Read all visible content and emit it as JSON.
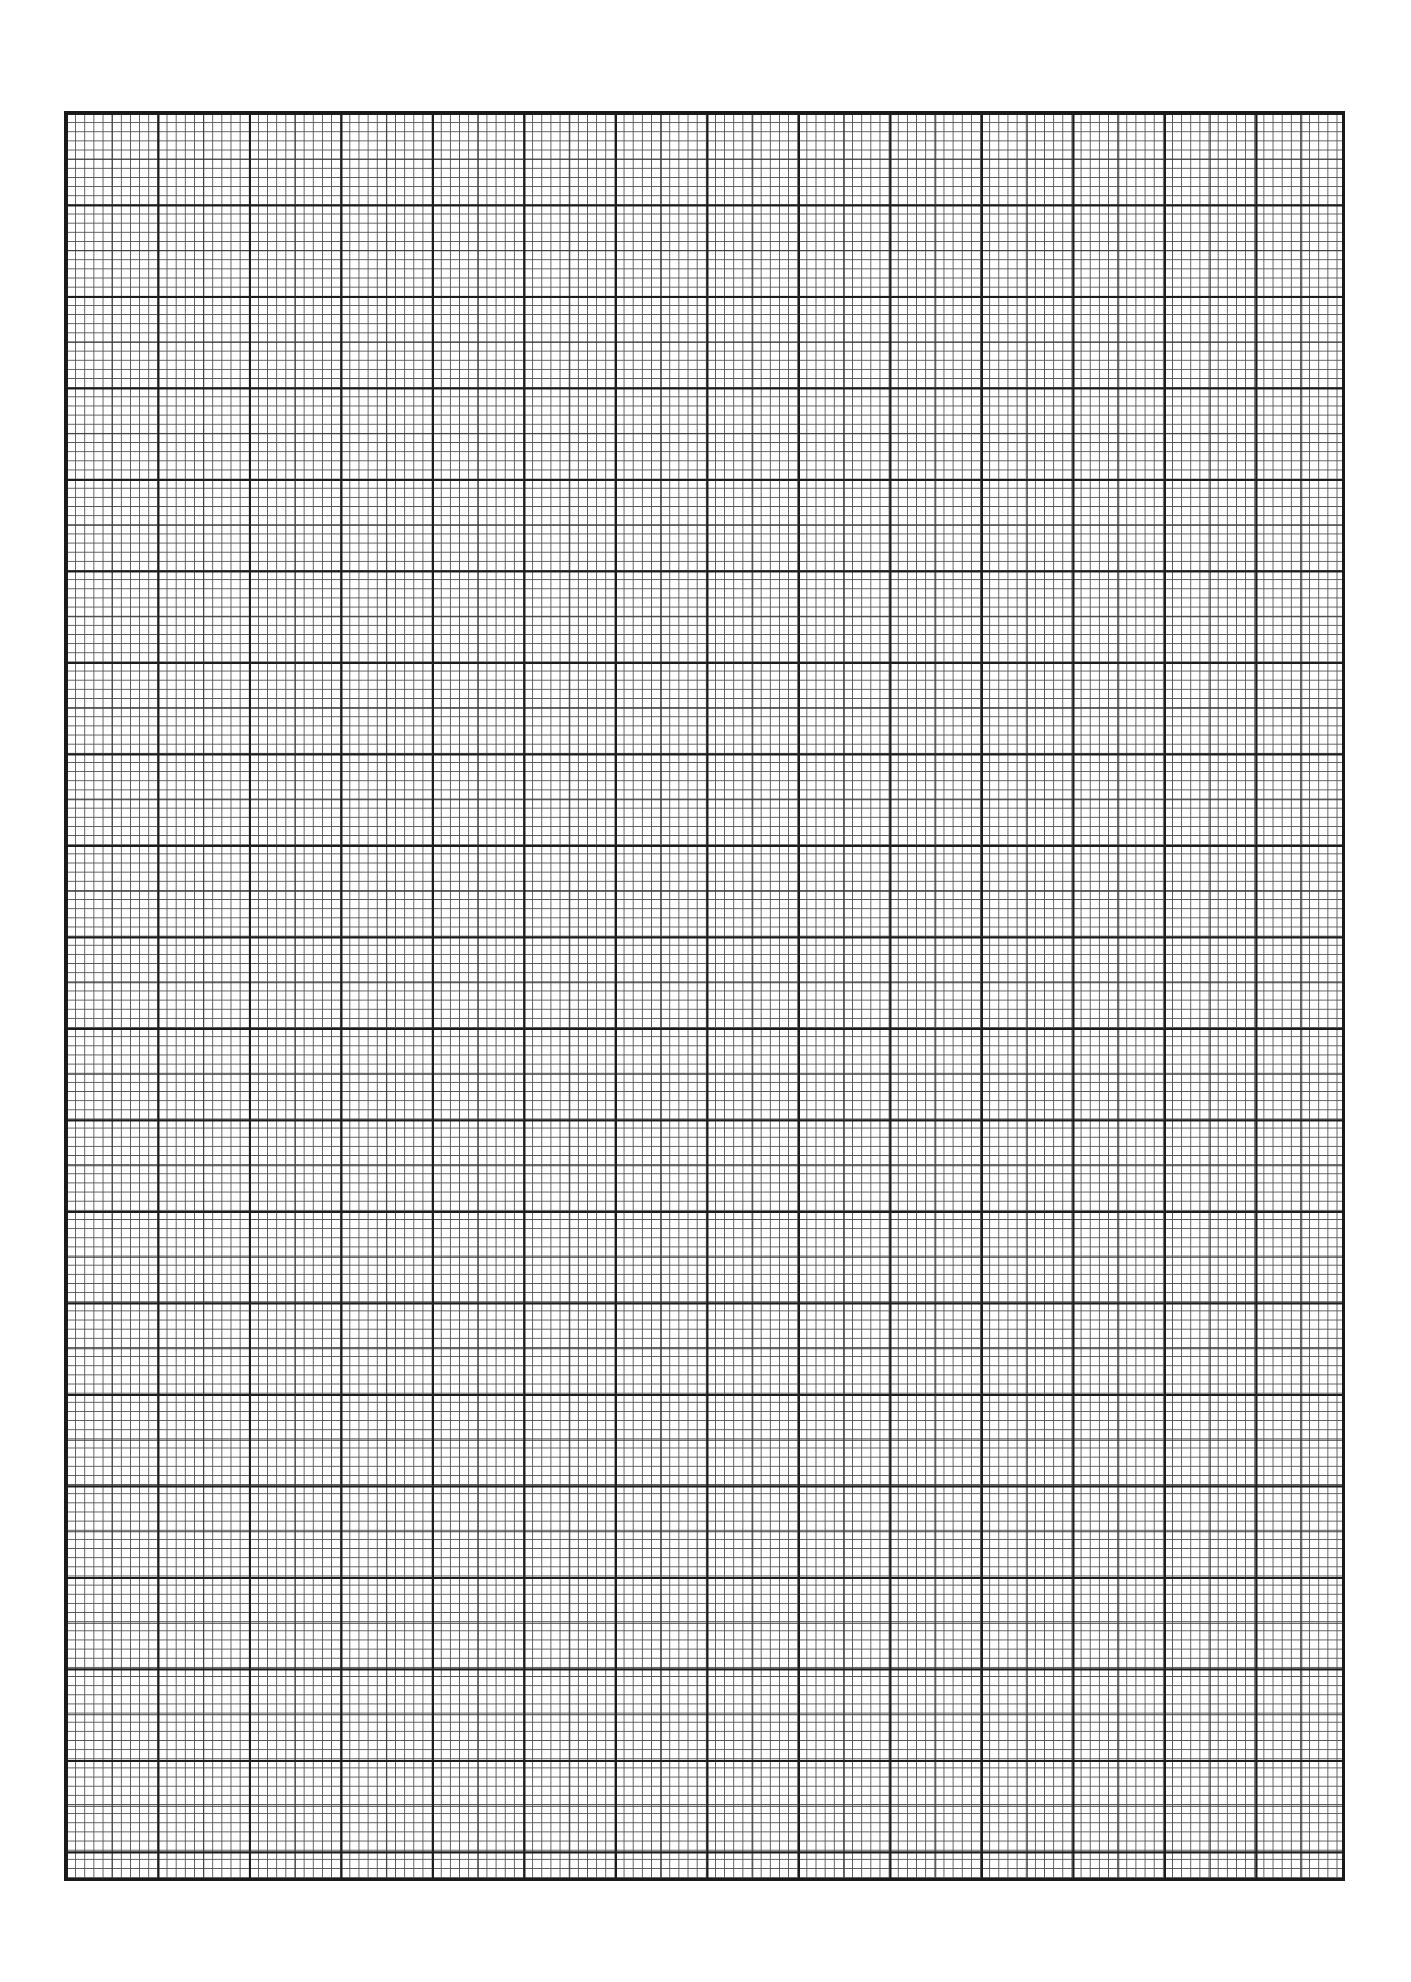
{
  "page": {
    "type": "graph-paper",
    "background_color": "#ffffff",
    "line_color": "#1c1c1c"
  },
  "grid": {
    "major_columns": 14,
    "major_rows": 19.3,
    "subdivisions_per_major": 10,
    "medium_line_every": 5
  }
}
